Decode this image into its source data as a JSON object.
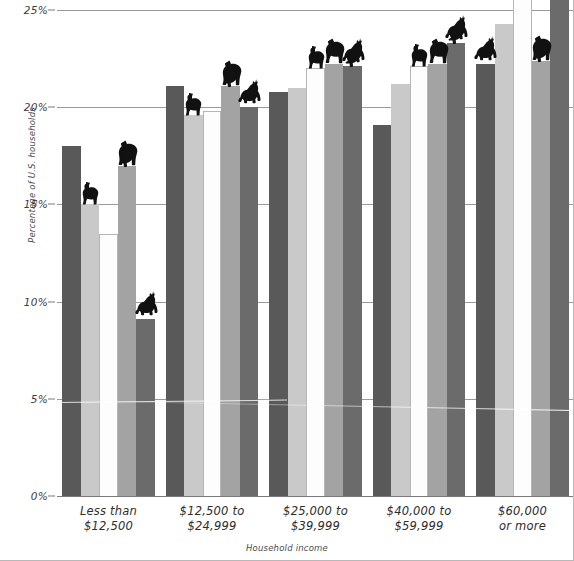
{
  "chart": {
    "type": "bar",
    "title": "",
    "xlabel": "Household income",
    "ylabel": "Percentage of U.S. households",
    "ylim": [
      0,
      25
    ],
    "ytick_labels": [
      "0%",
      "5%",
      "10%",
      "15%",
      "20%",
      "25%"
    ],
    "ytick_values": [
      0,
      5,
      10,
      15,
      20,
      25
    ],
    "grid": true,
    "legend": "none",
    "categories": [
      "Less than\n$12,500",
      "$12,500 to\n$24,999",
      "$25,000 to\n$39,999",
      "$40,000 to\n$59,999",
      "$60,000\nor more"
    ],
    "category_lines": [
      [
        "Less than",
        "$12,500"
      ],
      [
        "$12,500 to",
        "$24,999"
      ],
      [
        "$25,000 to",
        "$39,999"
      ],
      [
        "$40,000 to",
        "$59,999"
      ],
      [
        "$60,000",
        "or more"
      ]
    ],
    "series": [
      {
        "name": "series-1",
        "color": "#595959",
        "values": [
          18.0,
          21.1,
          20.8,
          19.1,
          22.2
        ]
      },
      {
        "name": "series-2",
        "color": "#c9c9c9",
        "values": [
          15.0,
          19.6,
          21.0,
          21.2,
          24.3
        ]
      },
      {
        "name": "series-3",
        "color": "#fdfdfd",
        "values": [
          13.5,
          19.8,
          22.0,
          22.1,
          25.6
        ]
      },
      {
        "name": "series-4",
        "color": "#a3a3a3",
        "values": [
          17.0,
          21.1,
          22.2,
          22.2,
          22.4
        ]
      },
      {
        "name": "series-5",
        "color": "#6b6b6b",
        "values": [
          9.1,
          20.0,
          22.1,
          23.3,
          25.8
        ]
      }
    ],
    "animal_markers": [
      {
        "group": 0,
        "bar": 1,
        "animal": "dog"
      },
      {
        "group": 0,
        "bar": 3,
        "animal": "cat"
      },
      {
        "group": 0,
        "bar": 3,
        "animal": "bird"
      },
      {
        "group": 0,
        "bar": 4,
        "animal": "horse"
      },
      {
        "group": 1,
        "bar": 1,
        "animal": "dog"
      },
      {
        "group": 1,
        "bar": 3,
        "animal": "cat"
      },
      {
        "group": 1,
        "bar": 3,
        "animal": "bird"
      },
      {
        "group": 1,
        "bar": 4,
        "animal": "horse"
      },
      {
        "group": 2,
        "bar": 2,
        "animal": "dog"
      },
      {
        "group": 2,
        "bar": 3,
        "animal": "cat"
      },
      {
        "group": 2,
        "bar": 4,
        "animal": "bird"
      },
      {
        "group": 2,
        "bar": 4,
        "animal": "horse"
      },
      {
        "group": 3,
        "bar": 2,
        "animal": "dog"
      },
      {
        "group": 3,
        "bar": 3,
        "animal": "cat"
      },
      {
        "group": 3,
        "bar": 4,
        "animal": "horse"
      },
      {
        "group": 3,
        "bar": 4,
        "animal": "bird"
      },
      {
        "group": 4,
        "bar": 0,
        "animal": "horse"
      },
      {
        "group": 4,
        "bar": 2,
        "animal": "dog"
      },
      {
        "group": 4,
        "bar": 3,
        "animal": "cat"
      },
      {
        "group": 4,
        "bar": 3,
        "animal": "bird"
      },
      {
        "group": 4,
        "bar": 4,
        "animal": "horse"
      }
    ],
    "colors": {
      "gridline": "#9a9a9a",
      "axis_text": "#3d3d3d",
      "background": "#ffffff"
    }
  }
}
